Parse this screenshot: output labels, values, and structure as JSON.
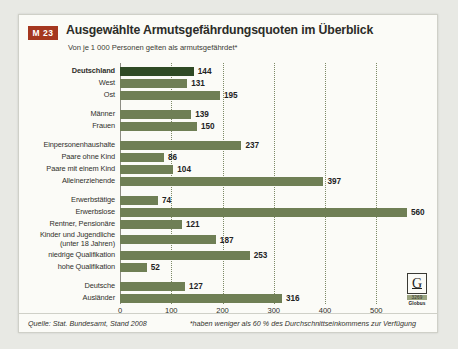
{
  "header": {
    "badge": "M 23",
    "title": "Ausgewählte Armutsgefährdungsquoten im Überblick",
    "subtitle": "Von je 1 000 Personen gelten als armutsgefährdet*"
  },
  "footer": {
    "source": "Quelle: Stat. Bundesamt, Stand 2008",
    "note": "*haben weniger als 60 % des Durchschnittseinkommens zur Verfügung"
  },
  "logo": {
    "letter": "G",
    "number": "3269",
    "name": "Globus"
  },
  "colors": {
    "bar": "#6f7f55",
    "bar_highlight": "#2f4a25",
    "badge": "#a5371f",
    "card": "#fbfbf7",
    "page": "#e8e9e4"
  },
  "chart_data": {
    "type": "bar",
    "orientation": "horizontal",
    "title": "Ausgewählte Armutsgefährdungsquoten im Überblick",
    "subtitle": "Von je 1 000 Personen gelten als armutsgefährdet*",
    "xlabel": "",
    "ylabel": "",
    "xlim": [
      0,
      580
    ],
    "ticks": [
      0,
      100,
      200,
      300,
      400,
      500
    ],
    "gridlines": [
      100,
      200,
      300,
      400,
      500
    ],
    "grid": true,
    "legend": false,
    "categories": [
      "Deutschland",
      "West",
      "Ost",
      "Männer",
      "Frauen",
      "Einpersonenhaushalte",
      "Paare ohne Kind",
      "Paare mit einem Kind",
      "Alleinerziehende",
      "Erwerbstätige",
      "Erwerbslose",
      "Rentner, Pensionäre",
      "Kinder und Jugendliche\n(unter 18 Jahren)",
      "niedrige Qualifikation",
      "hohe Qualifikation",
      "Deutsche",
      "Ausländer"
    ],
    "values": [
      144,
      131,
      195,
      139,
      150,
      237,
      86,
      104,
      397,
      74,
      560,
      121,
      187,
      253,
      52,
      127,
      316
    ],
    "highlight_index": 0,
    "groups": [
      [
        "Deutschland",
        "West",
        "Ost"
      ],
      [
        "Männer",
        "Frauen"
      ],
      [
        "Einpersonenhaushalte",
        "Paare ohne Kind",
        "Paare mit einem Kind",
        "Alleinerziehende"
      ],
      [
        "Erwerbstätige",
        "Erwerbslose",
        "Rentner, Pensionäre",
        "Kinder und Jugendliche\n(unter 18 Jahren)",
        "niedrige Qualifikation",
        "hohe Qualifikation"
      ],
      [
        "Deutsche",
        "Ausländer"
      ]
    ],
    "group_breaks_after": [
      2,
      4,
      8,
      14
    ],
    "bold_categories": [
      "Deutschland"
    ]
  }
}
